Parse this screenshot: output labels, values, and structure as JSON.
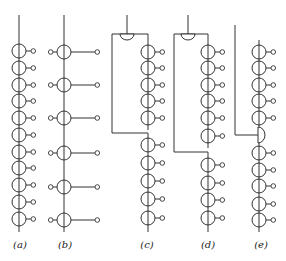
{
  "figure": {
    "panels": [
      {
        "id": "a",
        "label": "(a)",
        "label_x": 20,
        "line_x": 19,
        "top": 15,
        "bottom": 232,
        "circles": [
          51,
          68,
          85,
          101,
          118,
          135,
          152,
          168,
          185,
          202,
          219
        ],
        "tap": "right-short"
      },
      {
        "id": "b",
        "label": "(b)",
        "label_x": 65,
        "line_x": 64,
        "top": 15,
        "bottom": 232,
        "circles": [
          52,
          85,
          118,
          153,
          187,
          220
        ],
        "tap": "both-long"
      },
      {
        "id": "c",
        "label": "(c)",
        "label_x": 147,
        "input_x": 127,
        "left_x": 112,
        "main_x": 148,
        "split_y": 34,
        "join_y": 133,
        "bottom": 232,
        "upper_circles": [
          52,
          68,
          85,
          101,
          118
        ],
        "lower_circles": [
          145,
          163,
          181,
          199,
          218
        ]
      },
      {
        "id": "d",
        "label": "(d)",
        "label_x": 208,
        "input_x": 188,
        "left_x": 174,
        "main_x": 208,
        "split_y": 34,
        "join_y": 152,
        "bottom": 232,
        "upper_circles": [
          52,
          68,
          85,
          101,
          118,
          136
        ],
        "lower_circles": [
          165,
          183,
          200,
          218
        ]
      },
      {
        "id": "e",
        "label": "(e)",
        "label_x": 261,
        "input_x": 235,
        "main_x": 259,
        "input_top": 25,
        "combiner_y": 135,
        "top": 40,
        "bottom": 232,
        "upper_circles": [
          52,
          68,
          85,
          101,
          118
        ],
        "lower_circles": [
          153,
          170,
          186,
          204,
          220
        ]
      }
    ]
  }
}
